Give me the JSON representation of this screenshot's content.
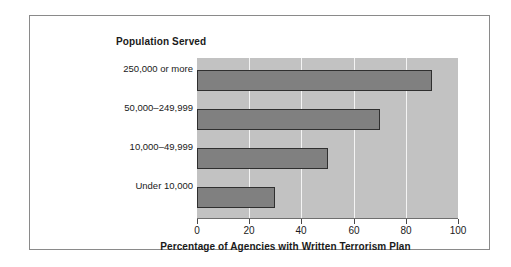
{
  "chart_data": {
    "type": "bar",
    "orientation": "horizontal",
    "title": "Population Served",
    "xlabel": "Percentage of Agencies with Written Terrorism Plan",
    "ylabel": "Population Served",
    "categories": [
      "250,000 or more",
      "50,000–249,999",
      "10,000–49,999",
      "Under 10,000"
    ],
    "values": [
      90,
      70,
      50,
      30
    ],
    "xlim": [
      0,
      100
    ],
    "xticks": [
      0,
      20,
      40,
      60,
      80,
      100
    ],
    "xtick_labels": [
      "0",
      "20",
      "40",
      "60",
      "80",
      "100"
    ],
    "grid": "vertical-only",
    "legend": "none",
    "colors": {
      "bar_fill": "#808080",
      "bar_edge": "#2f2f2f",
      "plot_background": "#c2c2c2",
      "gridline": "#f4f4f4",
      "figure_background": "#ffffff",
      "frame_border": "#8a8a8a",
      "text": "#1a1a1a"
    }
  }
}
